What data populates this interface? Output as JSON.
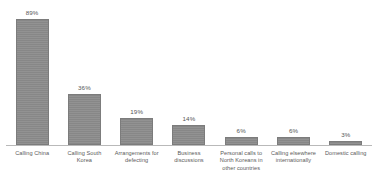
{
  "chart_data": {
    "type": "bar",
    "title": "",
    "subtitle": "",
    "xlabel": "",
    "ylabel": "",
    "ylim": [
      0,
      100
    ],
    "grid": false,
    "legend": false,
    "legend_position": "none",
    "orientation": "vertical",
    "value_labels_shown": true,
    "value_label_suffix": "%",
    "categories": [
      "Calling China",
      "Calling South Korea",
      "Arrangements for defecting",
      "Business discussions",
      "Personal calls to North Koreans in other countries",
      "Calling elsewhere internationally",
      "Domestic calling"
    ],
    "values": [
      89,
      36,
      19,
      14,
      6,
      6,
      3
    ],
    "value_labels": [
      "89%",
      "36%",
      "19%",
      "14%",
      "6%",
      "6%",
      "3%"
    ],
    "series": [
      {
        "name": "",
        "values": [
          89,
          36,
          19,
          14,
          6,
          6,
          3
        ]
      }
    ]
  },
  "style": {
    "bar_fill": "#8c8c8c",
    "bar_stroke": "#7c7c7c",
    "axis_color": "#b9b9b9",
    "label_color": "#5a5a5a",
    "value_color": "#555555",
    "background": "#ffffff"
  }
}
